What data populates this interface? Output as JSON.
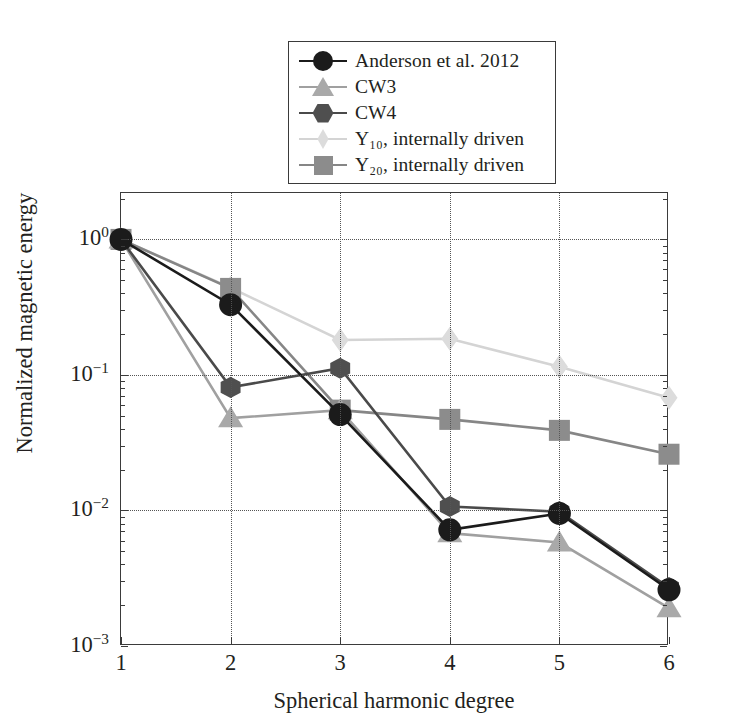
{
  "chart_data": {
    "type": "line",
    "title": "",
    "xlabel": "Spherical harmonic degree",
    "ylabel": "Normalized magnetic energy",
    "x": [
      1,
      2,
      3,
      4,
      5,
      6
    ],
    "xtick_labels": [
      "1",
      "2",
      "3",
      "4",
      "5",
      "6"
    ],
    "xlim": [
      1,
      6
    ],
    "ylim": [
      0.001,
      2.2
    ],
    "yscale": "log",
    "ytick_values": [
      1,
      0.1,
      0.01,
      0.001
    ],
    "ytick_labels": [
      "10",
      "10",
      "10",
      "10"
    ],
    "ytick_exponents": [
      "0",
      "-1",
      "-2",
      "-3"
    ],
    "grid": true,
    "grid_style": "dotted",
    "legend_position": "above-plot-center",
    "series": [
      {
        "name": "Anderson et al. 2012",
        "marker": "circle",
        "color": "#1b1b1b",
        "line_color": "#1b1b1b",
        "values": [
          1.0,
          0.33,
          0.051,
          0.0072,
          0.0095,
          0.0026
        ]
      },
      {
        "name": "CW3",
        "marker": "triangle",
        "color": "#a9a9a9",
        "line_color": "#a0a0a0",
        "values": [
          1.0,
          0.048,
          0.055,
          0.0068,
          0.0058,
          0.0019
        ]
      },
      {
        "name": "CW4",
        "marker": "hexagon",
        "color": "#4f4f4f",
        "line_color": "#4a4a4a",
        "values": [
          1.0,
          0.081,
          0.112,
          0.0107,
          0.0098,
          0.0027
        ]
      },
      {
        "name": "Y10, internally driven",
        "label_base": "Y",
        "label_sub": "10",
        "label_rest": ", internally driven",
        "marker": "diamond",
        "color": "#dcdcdc",
        "line_color": "#d4d4d4",
        "values": [
          1.0,
          0.44,
          0.181,
          0.185,
          0.115,
          0.068
        ]
      },
      {
        "name": "Y20, internally driven",
        "label_base": "Y",
        "label_sub": "20",
        "label_rest": ", internally driven",
        "marker": "square",
        "color": "#8c8c8c",
        "line_color": "#868686",
        "values": [
          1.0,
          0.435,
          0.055,
          0.047,
          0.039,
          0.026
        ]
      }
    ]
  },
  "legend": {
    "items": [
      {
        "label": "Anderson et al. 2012",
        "icon": "circle-marker-icon"
      },
      {
        "label": "CW3",
        "icon": "triangle-marker-icon"
      },
      {
        "label": "CW4",
        "icon": "hexagon-marker-icon"
      },
      {
        "label": "Y₁₀, internally driven",
        "icon": "diamond-marker-icon"
      },
      {
        "label": "Y₂₀, internally driven",
        "icon": "square-marker-icon"
      }
    ]
  },
  "axes": {
    "x_title": "Spherical harmonic degree",
    "y_title": "Normalized magnetic energy",
    "x_ticks": [
      "1",
      "2",
      "3",
      "4",
      "5",
      "6"
    ],
    "y_ticks": [
      {
        "mantissa": "10",
        "exponent": "0"
      },
      {
        "mantissa": "10",
        "exponent": "-1"
      },
      {
        "mantissa": "10",
        "exponent": "-2"
      },
      {
        "mantissa": "10",
        "exponent": "-3"
      }
    ]
  },
  "colors": {
    "axis": "#3b3b3b",
    "grid": "#555555",
    "background": "#ffffff",
    "text": "#231f20"
  }
}
